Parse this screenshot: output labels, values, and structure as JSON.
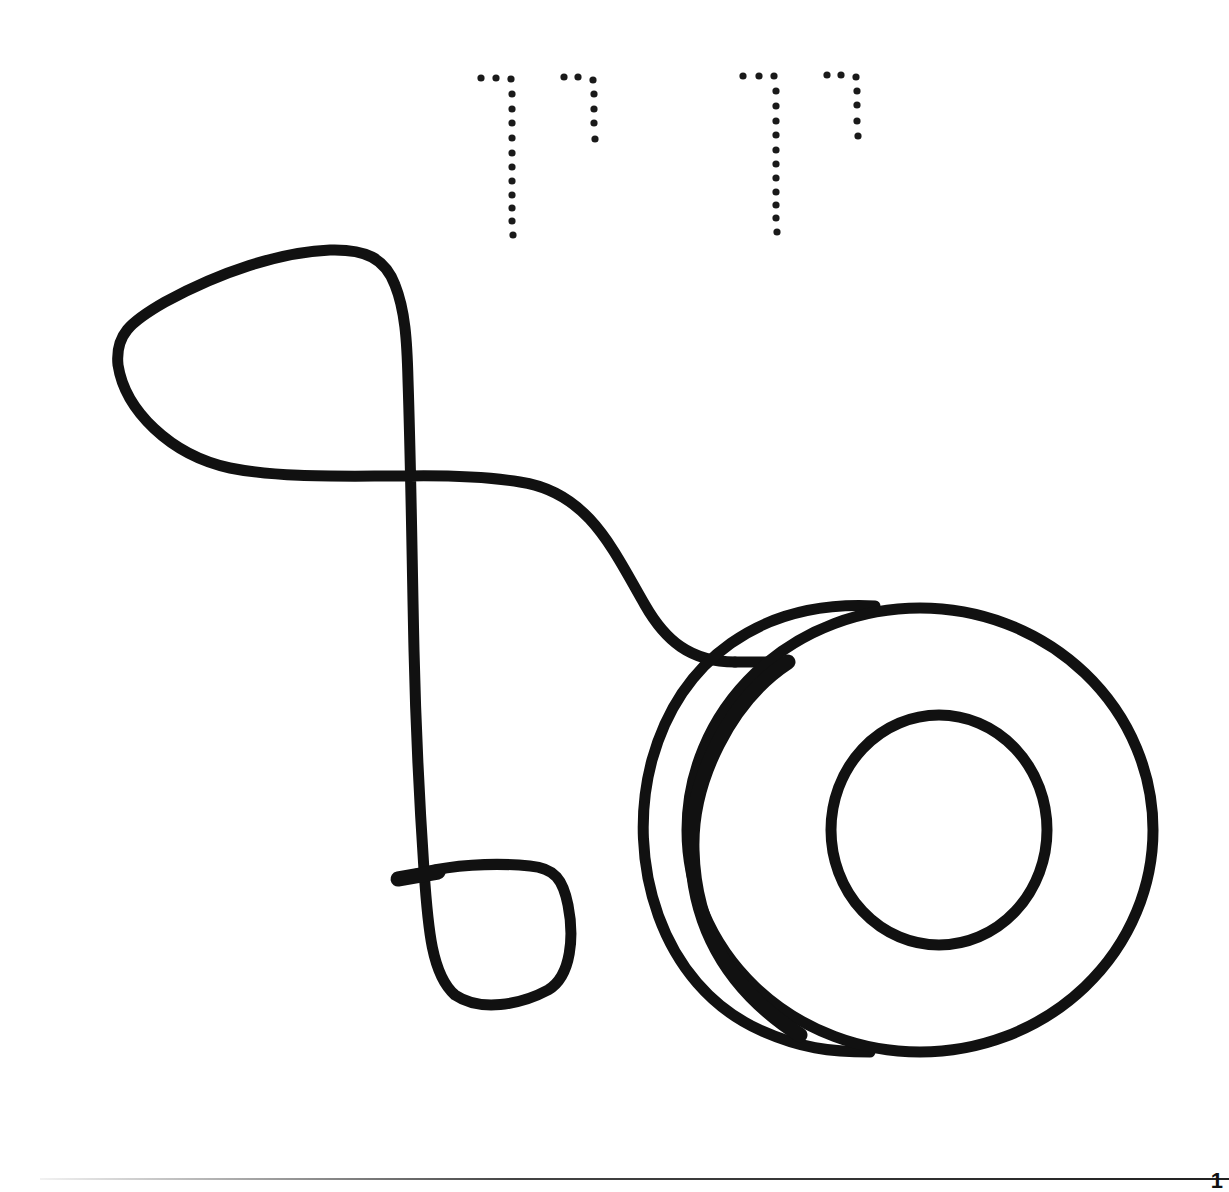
{
  "worksheet": {
    "title_text": "יו יו",
    "title_style": "dotted-tracing",
    "illustration": "yo-yo-with-string",
    "page_number": "1"
  },
  "colors": {
    "background": "#ffffff",
    "ink": "#111111",
    "dots": "#1a1a1a"
  }
}
